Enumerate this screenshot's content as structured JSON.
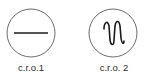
{
  "diagram": {
    "items": [
      {
        "label": "c.r.o.1",
        "display": "flat-line",
        "icon": "flat-line-icon"
      },
      {
        "label": "c.r.o. 2",
        "display": "oscillating-wave",
        "icon": "wave-icon"
      }
    ],
    "colors": {
      "circle_stroke": "#6a6a6a",
      "trace_stroke": "#1a1a1a",
      "label_text": "#2a2a2a",
      "background": "#ffffff"
    }
  }
}
